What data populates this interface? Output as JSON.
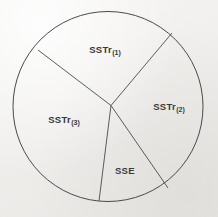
{
  "figure": {
    "kind": "partition-circle-diagram",
    "background_color": "#f3f2f0",
    "ink_color": "#4a494b",
    "label_color": "#39383a"
  },
  "chart_data": {
    "type": "pie",
    "title": "",
    "subtitle": "",
    "xlabel": "",
    "ylabel": "",
    "grid": false,
    "legend_position": "none",
    "center": {
      "x": 108,
      "y": 106.5
    },
    "radius": 95,
    "junction": {
      "x": 111,
      "y": 105.5
    },
    "categories": [
      "SSTr(1)",
      "SSTr(2)",
      "SSE",
      "SSTr(3)"
    ],
    "values": [
      28,
      24,
      14,
      34
    ],
    "boundary_angles_deg": [
      315,
      57,
      104,
      210
    ],
    "boundary_points": [
      {
        "x": 172,
        "y": 33
      },
      {
        "x": 168,
        "y": 188
      },
      {
        "x": 99,
        "y": 201
      },
      {
        "x": 38,
        "y": 50
      }
    ],
    "slices": [
      {
        "id": "sstr1",
        "base": "SSTr",
        "subscript": "(1)",
        "value": 28,
        "start_angle_deg": 210,
        "end_angle_deg": 315,
        "label_x": 105,
        "label_y": 50
      },
      {
        "id": "sstr2",
        "base": "SSTr",
        "subscript": "(2)",
        "value": 24,
        "start_angle_deg": 315,
        "end_angle_deg": 57,
        "label_x": 169,
        "label_y": 107
      },
      {
        "id": "sse",
        "base": "SSE",
        "subscript": "",
        "value": 14,
        "start_angle_deg": 57,
        "end_angle_deg": 104,
        "label_x": 125,
        "label_y": 171
      },
      {
        "id": "sstr3",
        "base": "SSTr",
        "subscript": "(3)",
        "value": 34,
        "start_angle_deg": 104,
        "end_angle_deg": 210,
        "label_x": 64,
        "label_y": 120
      }
    ]
  }
}
